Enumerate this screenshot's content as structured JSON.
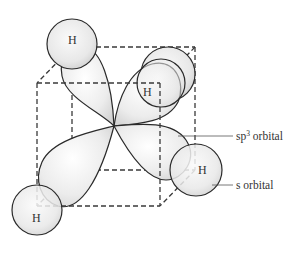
{
  "diagram": {
    "atom_label": "H",
    "atoms": [
      {
        "id": "h-top-left",
        "label": "H"
      },
      {
        "id": "h-upper-right",
        "label": "H"
      },
      {
        "id": "h-right",
        "label": "H"
      },
      {
        "id": "h-bottom-left",
        "label": "H"
      }
    ],
    "callouts": {
      "sp3": {
        "base": "sp",
        "superscript": "3",
        "suffix": " orbital"
      },
      "s": {
        "text": "s orbital"
      }
    },
    "colors": {
      "line": "#2a2a2a",
      "dashed_edge": "#3a3a3a",
      "fill_light": "#ffffff",
      "fill_shade": "#d4d4d4"
    }
  }
}
